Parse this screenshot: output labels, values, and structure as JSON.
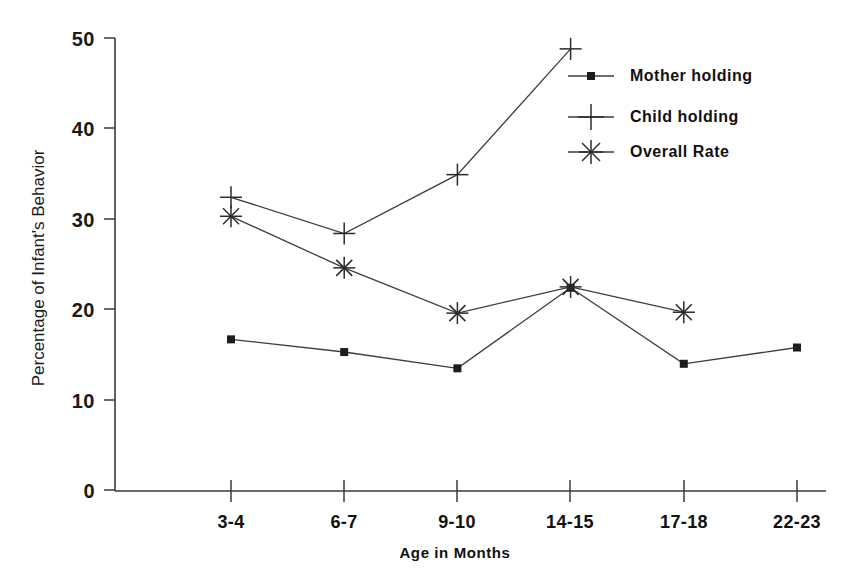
{
  "chart_data": {
    "type": "line",
    "title": "",
    "xlabel": "Age in Months",
    "ylabel": "Percentage of Infant's Behavior",
    "categories": [
      "3-4",
      "6-7",
      "9-10",
      "14-15",
      "17-18",
      "22-23"
    ],
    "ylim": [
      0,
      50
    ],
    "yticks": [
      0,
      10,
      20,
      30,
      40,
      50
    ],
    "ytick_labels": [
      "0",
      "10",
      "20",
      "30",
      "40",
      "50"
    ],
    "grid": false,
    "legend_position": "upper right",
    "series": [
      {
        "name": "Mother holding",
        "marker": "square",
        "values": [
          16.7,
          15.3,
          13.5,
          22.4,
          14.0,
          15.8
        ]
      },
      {
        "name": "Child holding",
        "marker": "plus",
        "values": [
          32.4,
          28.4,
          34.9,
          48.8,
          null,
          null
        ]
      },
      {
        "name": "Overall Rate",
        "marker": "asterisk",
        "values": [
          30.3,
          24.6,
          19.6,
          22.5,
          19.7,
          null
        ]
      }
    ]
  },
  "axes": {
    "y_title": "Percentage of Infant's Behavior",
    "x_title": "Age in Months",
    "y_tick_labels": [
      "50",
      "40",
      "30",
      "20",
      "10",
      "0"
    ],
    "x_tick_labels": [
      "3-4",
      "6-7",
      "9-10",
      "14-15",
      "17-18",
      "22-23"
    ]
  },
  "legend": {
    "items": [
      {
        "label": "Mother holding",
        "marker": "square-marker"
      },
      {
        "label": "Child holding",
        "marker": "plus-marker"
      },
      {
        "label": "Overall Rate",
        "marker": "asterisk-marker"
      }
    ]
  },
  "colors": {
    "line": "#3d3d3d",
    "axis": "#3a3a3a",
    "text": "#111111",
    "background": "#ffffff"
  }
}
